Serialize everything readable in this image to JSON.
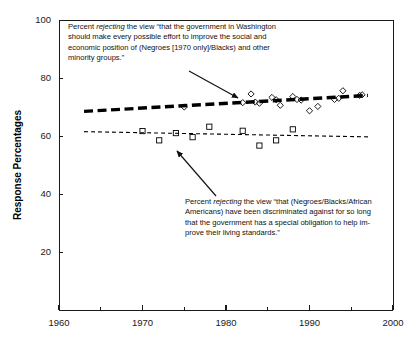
{
  "chart_data": {
    "type": "scatter",
    "title": "",
    "xlabel": "",
    "ylabel": "Response Percentages",
    "xlim": [
      1960,
      2000
    ],
    "ylim": [
      0,
      100
    ],
    "x_ticks": [
      1960,
      1970,
      1980,
      1990,
      2000
    ],
    "x_tick_labels": [
      "1960",
      "1970",
      "1980",
      "1990",
      "2000"
    ],
    "x_minor_ticks": [
      1965,
      1975,
      1985,
      1995
    ],
    "y_ticks": [
      20,
      40,
      60,
      80,
      100
    ],
    "y_tick_labels": [
      "20",
      "40",
      "60",
      "80",
      "100"
    ],
    "grid": false,
    "legend": "none",
    "series": [
      {
        "name": "Percent rejecting government-effort-to-improve-position view",
        "marker": "diamond",
        "marker_fill": "none",
        "trendline": "thick-dashed",
        "points": [
          {
            "x": 1975,
            "y": 70.0
          },
          {
            "x": 1982,
            "y": 71.5
          },
          {
            "x": 1983,
            "y": 74.5
          },
          {
            "x": 1983.5,
            "y": 71.7
          },
          {
            "x": 1984,
            "y": 71.3
          },
          {
            "x": 1985.5,
            "y": 73.3
          },
          {
            "x": 1986,
            "y": 72.5
          },
          {
            "x": 1986.5,
            "y": 70.6
          },
          {
            "x": 1988,
            "y": 73.6
          },
          {
            "x": 1988.5,
            "y": 72.6
          },
          {
            "x": 1989,
            "y": 72.4
          },
          {
            "x": 1990,
            "y": 68.7
          },
          {
            "x": 1991,
            "y": 70.2
          },
          {
            "x": 1993,
            "y": 72.6
          },
          {
            "x": 1993.5,
            "y": 73.0
          },
          {
            "x": 1994,
            "y": 75.6
          },
          {
            "x": 1996,
            "y": 74.0
          },
          {
            "x": 1996.3,
            "y": 74.2
          }
        ],
        "trend_start": {
          "x": 1963,
          "y": 68.5
        },
        "trend_end": {
          "x": 1997,
          "y": 74.0
        }
      },
      {
        "name": "Percent rejecting discrimination/special-obligation view",
        "marker": "square",
        "marker_fill": "none",
        "trendline": "thin-dashed",
        "points": [
          {
            "x": 1970,
            "y": 61.7
          },
          {
            "x": 1972,
            "y": 58.5
          },
          {
            "x": 1974,
            "y": 61.0
          },
          {
            "x": 1976,
            "y": 59.6
          },
          {
            "x": 1978,
            "y": 63.2
          },
          {
            "x": 1982,
            "y": 61.8
          },
          {
            "x": 1984,
            "y": 56.7
          },
          {
            "x": 1986,
            "y": 58.5
          },
          {
            "x": 1988,
            "y": 62.3
          }
        ],
        "trend_start": {
          "x": 1963,
          "y": 61.5
        },
        "trend_end": {
          "x": 1997,
          "y": 59.7
        }
      }
    ],
    "annotations": [
      {
        "id": "upper",
        "lines": [
          "Percent |rejecting| the view “that the government in Washington",
          "should make every possible effort to improve the social and",
          "economic position of (Negroes [1970 only]/Blacks) and other",
          "minority groups.”"
        ],
        "arrow_from": {
          "x": 189,
          "y": 71
        },
        "arrow_to": {
          "x": 238,
          "y": 98
        }
      },
      {
        "id": "lower",
        "lines": [
          "Percent |rejecting| the view “that (Negroes/Blacks/African",
          "Americans) have been discriminated against for so long",
          "that the government has a special obligation to help im-",
          "prove their living standards.”"
        ],
        "arrow_from": {
          "x": 216,
          "y": 196
        },
        "arrow_to": {
          "x": 177,
          "y": 151
        }
      }
    ]
  },
  "colors": {
    "ink": "#111111",
    "axis": "#1a1a1a",
    "marker": "#000000",
    "background": "#ffffff"
  }
}
